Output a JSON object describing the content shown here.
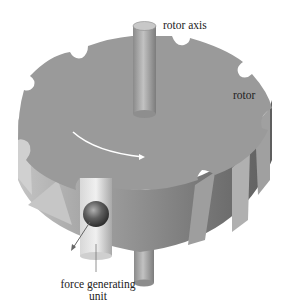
{
  "figure": {
    "labels": {
      "rotor_axis": "rotor axis",
      "rotor": "rotor",
      "force_generating_unit_line1": "force generating",
      "force_generating_unit_line2": "unit"
    },
    "colors": {
      "background": "#ffffff",
      "rotor_top": "#9a9a9a",
      "rotor_side_light": "#b5b5b5",
      "rotor_side_dark": "#6e6e6e",
      "axis_shaft": "#a8a8a8",
      "rotation_arrow": "#ffffff",
      "ball": "#555555",
      "text": "#222222"
    }
  }
}
